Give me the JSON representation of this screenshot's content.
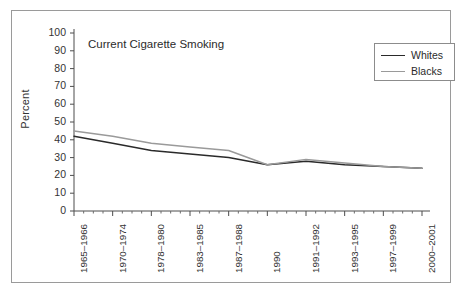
{
  "chart_data": {
    "type": "line",
    "title": "Current Cigarette Smoking",
    "xlabel": "",
    "ylabel": "Percent",
    "ylim": [
      0,
      100
    ],
    "ytick_step": 10,
    "yticks": [
      0,
      10,
      20,
      30,
      40,
      50,
      60,
      70,
      80,
      90,
      100
    ],
    "grid": false,
    "legend_position": "top-right",
    "categories": [
      "1965–1966",
      "1970–1974",
      "1978–1980",
      "1983–1985",
      "1987–1988",
      "1990",
      "1991–1992",
      "1993–1995",
      "1997–1999",
      "2000–2001"
    ],
    "series": [
      {
        "name": "Whites",
        "color": "#2a2a2a",
        "values": [
          42,
          38,
          34,
          32,
          30,
          26,
          28,
          26,
          25,
          24
        ]
      },
      {
        "name": "Blacks",
        "color": "#9a9a9a",
        "values": [
          45,
          42,
          38,
          36,
          34,
          26,
          29,
          27,
          25,
          24
        ]
      }
    ]
  },
  "legend": {
    "entries": [
      {
        "label": "Whites",
        "color": "#2a2a2a"
      },
      {
        "label": "Blacks",
        "color": "#9a9a9a"
      }
    ]
  }
}
